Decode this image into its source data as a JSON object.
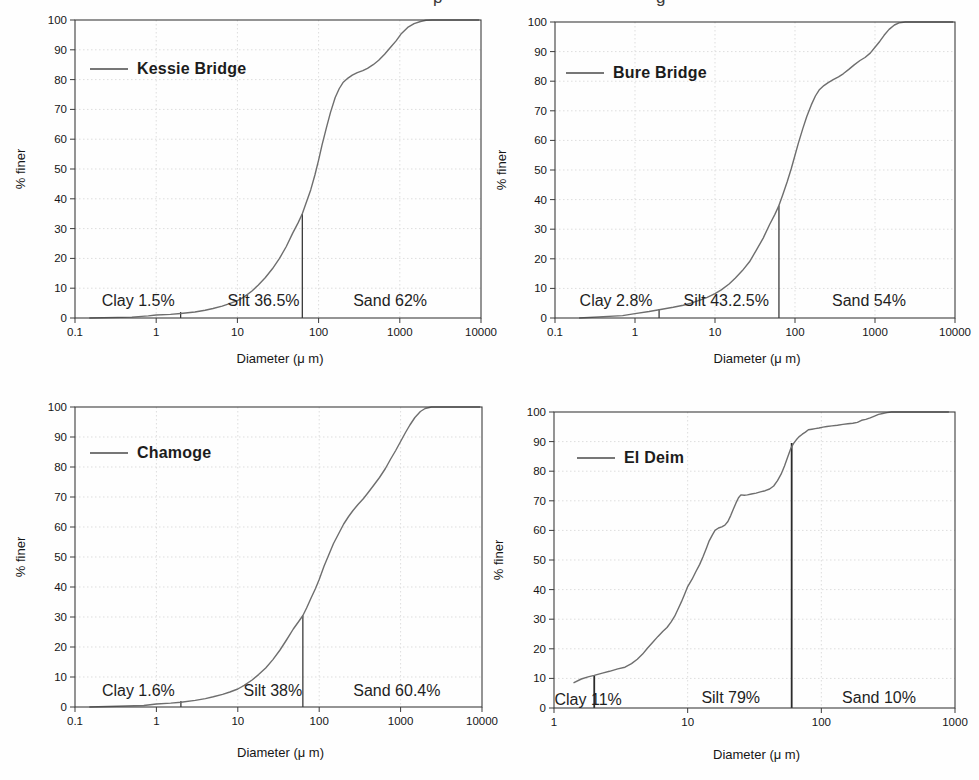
{
  "caption_fragments": [
    "p",
    "g"
  ],
  "colors": {
    "curve": "#6e6e6e",
    "frame": "#3c3c3c",
    "grid": "#dddddd",
    "text": "#161616",
    "annotation": "#1f1f1f",
    "boundary": "#2b2b2b"
  },
  "chart_data": [
    {
      "id": "kessie-bridge",
      "type": "line",
      "legend": "Kessie Bridge",
      "xlabel": "Diameter (μ m)",
      "ylabel": "% finer",
      "xscale": "log",
      "xlim": [
        0.1,
        10000
      ],
      "ylim": [
        0,
        100
      ],
      "x_ticks": [
        "0.1",
        "1",
        "10",
        "100",
        "1000",
        "10000"
      ],
      "y_ticks": [
        "0",
        "10",
        "20",
        "30",
        "40",
        "50",
        "60",
        "70",
        "80",
        "90",
        "100"
      ],
      "grid": true,
      "annotations": [
        {
          "text": "Clay 1.5%",
          "x": 0.6,
          "y": 6
        },
        {
          "text": "Silt 36.5%",
          "x": 21,
          "y": 6
        },
        {
          "text": "Sand 62%",
          "x": 760,
          "y": 6
        }
      ],
      "boundary_lines": [
        {
          "x": 2,
          "y_top": 2
        },
        {
          "x": 63,
          "y_top": 35
        }
      ],
      "series": [
        {
          "name": "Kessie Bridge",
          "points": [
            [
              0.15,
              0
            ],
            [
              0.5,
              0.3
            ],
            [
              0.8,
              0.7
            ],
            [
              1,
              1
            ],
            [
              1.5,
              1.2
            ],
            [
              2,
              1.5
            ],
            [
              3,
              2
            ],
            [
              4,
              2.6
            ],
            [
              5,
              3.2
            ],
            [
              6.5,
              4
            ],
            [
              8,
              4.8
            ],
            [
              10,
              5.8
            ],
            [
              12,
              7
            ],
            [
              15,
              9
            ],
            [
              18,
              11
            ],
            [
              22,
              13.5
            ],
            [
              27,
              16.5
            ],
            [
              33,
              20
            ],
            [
              40,
              24
            ],
            [
              48,
              28.5
            ],
            [
              56,
              32
            ],
            [
              63,
              35
            ],
            [
              70,
              38.5
            ],
            [
              80,
              43
            ],
            [
              90,
              48
            ],
            [
              100,
              53
            ],
            [
              110,
              58
            ],
            [
              125,
              64
            ],
            [
              140,
              69
            ],
            [
              160,
              74
            ],
            [
              180,
              77
            ],
            [
              200,
              79
            ],
            [
              230,
              80.5
            ],
            [
              260,
              81.5
            ],
            [
              300,
              82.3
            ],
            [
              350,
              83
            ],
            [
              400,
              83.8
            ],
            [
              470,
              85
            ],
            [
              550,
              86.5
            ],
            [
              650,
              88.5
            ],
            [
              780,
              91
            ],
            [
              900,
              93
            ],
            [
              1050,
              95.5
            ],
            [
              1250,
              97.5
            ],
            [
              1500,
              98.8
            ],
            [
              1800,
              99.5
            ],
            [
              2100,
              99.9
            ],
            [
              2500,
              100
            ],
            [
              9500,
              100
            ]
          ]
        }
      ]
    },
    {
      "id": "bure-bridge",
      "type": "line",
      "legend": "Bure Bridge",
      "xlabel": "Diameter (μ m)",
      "ylabel": "% finer",
      "xscale": "log",
      "xlim": [
        0.1,
        10000
      ],
      "ylim": [
        0,
        100
      ],
      "x_ticks": [
        "0.1",
        "1",
        "10",
        "100",
        "1000",
        "10000"
      ],
      "y_ticks": [
        "0",
        "10",
        "20",
        "30",
        "40",
        "50",
        "60",
        "70",
        "80",
        "90",
        "100"
      ],
      "grid": true,
      "annotations": [
        {
          "text": "Clay 2.8%",
          "x": 0.58,
          "y": 6
        },
        {
          "text": "Silt 43.2.5%",
          "x": 13.8,
          "y": 6
        },
        {
          "text": "Sand 54%",
          "x": 840,
          "y": 6
        }
      ],
      "boundary_lines": [
        {
          "x": 2,
          "y_top": 3
        },
        {
          "x": 63,
          "y_top": 38
        }
      ],
      "series": [
        {
          "name": "Bure Bridge",
          "points": [
            [
              0.2,
              0
            ],
            [
              0.7,
              0.8
            ],
            [
              1,
              1.5
            ],
            [
              1.5,
              2.2
            ],
            [
              2,
              2.8
            ],
            [
              3,
              3.6
            ],
            [
              4,
              4.3
            ],
            [
              5,
              5
            ],
            [
              6.5,
              6
            ],
            [
              8,
              7
            ],
            [
              10,
              8.2
            ],
            [
              12,
              9.5
            ],
            [
              15,
              11.5
            ],
            [
              18,
              13.5
            ],
            [
              22,
              16
            ],
            [
              27,
              19
            ],
            [
              33,
              23
            ],
            [
              40,
              27
            ],
            [
              48,
              31.5
            ],
            [
              56,
              35
            ],
            [
              63,
              38
            ],
            [
              70,
              41.5
            ],
            [
              80,
              46
            ],
            [
              90,
              50.5
            ],
            [
              100,
              55
            ],
            [
              110,
              59
            ],
            [
              125,
              64
            ],
            [
              140,
              68
            ],
            [
              160,
              72
            ],
            [
              180,
              75
            ],
            [
              200,
              77
            ],
            [
              230,
              78.5
            ],
            [
              260,
              79.5
            ],
            [
              300,
              80.5
            ],
            [
              350,
              81.5
            ],
            [
              400,
              82.5
            ],
            [
              470,
              84
            ],
            [
              550,
              85.5
            ],
            [
              650,
              87
            ],
            [
              750,
              88
            ],
            [
              870,
              89.5
            ],
            [
              1000,
              91.5
            ],
            [
              1150,
              93.5
            ],
            [
              1300,
              95.5
            ],
            [
              1500,
              97.5
            ],
            [
              1750,
              99
            ],
            [
              2000,
              99.7
            ],
            [
              2400,
              100
            ],
            [
              9500,
              100
            ]
          ]
        }
      ]
    },
    {
      "id": "chamoge",
      "type": "line",
      "legend": "Chamoge",
      "xlabel": "Diameter (μ m)",
      "ylabel": "% finer",
      "xscale": "log",
      "xlim": [
        0.1,
        10000
      ],
      "ylim": [
        0,
        100
      ],
      "x_ticks": [
        "0.1",
        "1",
        "10",
        "100",
        "1000",
        "10000"
      ],
      "y_ticks": [
        "0",
        "10",
        "20",
        "30",
        "40",
        "50",
        "60",
        "70",
        "80",
        "90",
        "100"
      ],
      "grid": true,
      "annotations": [
        {
          "text": "Clay 1.6%",
          "x": 0.6,
          "y": 5.5
        },
        {
          "text": "Silt 38%",
          "x": 27,
          "y": 5.5
        },
        {
          "text": "Sand 60.4%",
          "x": 900,
          "y": 5.5
        }
      ],
      "boundary_lines": [
        {
          "x": 2,
          "y_top": 2
        },
        {
          "x": 63,
          "y_top": 30.5
        }
      ],
      "series": [
        {
          "name": "Chamoge",
          "points": [
            [
              0.15,
              0
            ],
            [
              0.7,
              0.5
            ],
            [
              1,
              1
            ],
            [
              1.5,
              1.3
            ],
            [
              2,
              1.6
            ],
            [
              3,
              2.2
            ],
            [
              4,
              2.8
            ],
            [
              5,
              3.4
            ],
            [
              6.5,
              4.2
            ],
            [
              8,
              5
            ],
            [
              10,
              6
            ],
            [
              12,
              7.2
            ],
            [
              15,
              9
            ],
            [
              18,
              10.8
            ],
            [
              22,
              13
            ],
            [
              27,
              15.8
            ],
            [
              33,
              19
            ],
            [
              40,
              22.5
            ],
            [
              48,
              26
            ],
            [
              56,
              28.5
            ],
            [
              63,
              30.5
            ],
            [
              70,
              33
            ],
            [
              80,
              36.5
            ],
            [
              90,
              39.5
            ],
            [
              100,
              42.5
            ],
            [
              115,
              47
            ],
            [
              130,
              50.5
            ],
            [
              150,
              54.5
            ],
            [
              175,
              58
            ],
            [
              200,
              61
            ],
            [
              230,
              63.5
            ],
            [
              260,
              65.5
            ],
            [
              300,
              67.5
            ],
            [
              350,
              69.5
            ],
            [
              400,
              71.5
            ],
            [
              470,
              74
            ],
            [
              550,
              76.5
            ],
            [
              650,
              79.5
            ],
            [
              750,
              82.5
            ],
            [
              870,
              85.5
            ],
            [
              1000,
              88.5
            ],
            [
              1150,
              91.5
            ],
            [
              1300,
              94
            ],
            [
              1500,
              96.5
            ],
            [
              1750,
              98.5
            ],
            [
              2000,
              99.5
            ],
            [
              2400,
              100
            ],
            [
              9500,
              100
            ]
          ]
        }
      ]
    },
    {
      "id": "el-deim",
      "type": "line",
      "legend": "El Deim",
      "xlabel": "Diameter (μ m)",
      "ylabel": "% finer",
      "xscale": "log",
      "xlim": [
        1,
        1000
      ],
      "ylim": [
        0,
        100
      ],
      "x_ticks": [
        "1",
        "10",
        "100",
        "1000"
      ],
      "y_ticks": [
        "0",
        "10",
        "20",
        "30",
        "40",
        "50",
        "60",
        "70",
        "80",
        "90",
        "100"
      ],
      "grid": true,
      "annotations": [
        {
          "text": "Clay 11%",
          "x": 1.8,
          "y": 3
        },
        {
          "text": "Silt 79%",
          "x": 21,
          "y": 3.5
        },
        {
          "text": "Sand 10%",
          "x": 270,
          "y": 3.5
        }
      ],
      "boundary_lines": [
        {
          "x": 2,
          "y_top": 11
        },
        {
          "x": 60,
          "y_top": 89.5
        }
      ],
      "series": [
        {
          "name": "El Deim",
          "points": [
            [
              1.4,
              8.5
            ],
            [
              1.6,
              9.8
            ],
            [
              1.8,
              10.5
            ],
            [
              2,
              11
            ],
            [
              2.3,
              11.8
            ],
            [
              2.6,
              12.4
            ],
            [
              3,
              13.2
            ],
            [
              3.4,
              13.8
            ],
            [
              3.8,
              15
            ],
            [
              4.2,
              16.5
            ],
            [
              4.6,
              18.2
            ],
            [
              5,
              20.2
            ],
            [
              5.5,
              22.3
            ],
            [
              6,
              24.2
            ],
            [
              6.5,
              25.8
            ],
            [
              7,
              27.2
            ],
            [
              7.5,
              29
            ],
            [
              8,
              31
            ],
            [
              8.5,
              33.5
            ],
            [
              9,
              36
            ],
            [
              9.5,
              38.5
            ],
            [
              10,
              41
            ],
            [
              10.8,
              43.5
            ],
            [
              11.5,
              46
            ],
            [
              12.3,
              48.5
            ],
            [
              13,
              51
            ],
            [
              13.8,
              54
            ],
            [
              14.5,
              56.5
            ],
            [
              15.3,
              58.5
            ],
            [
              16,
              60
            ],
            [
              17,
              60.8
            ],
            [
              18,
              61.2
            ],
            [
              19,
              61.8
            ],
            [
              20,
              63
            ],
            [
              21,
              65
            ],
            [
              22,
              67.2
            ],
            [
              23,
              69.3
            ],
            [
              24,
              71
            ],
            [
              25,
              72
            ],
            [
              26.5,
              71.9
            ],
            [
              28,
              72
            ],
            [
              30,
              72.3
            ],
            [
              32.5,
              72.6
            ],
            [
              35,
              73
            ],
            [
              38,
              73.4
            ],
            [
              41,
              74
            ],
            [
              44,
              75
            ],
            [
              47,
              76.8
            ],
            [
              50,
              79
            ],
            [
              53,
              81.8
            ],
            [
              56,
              84.8
            ],
            [
              59,
              87.6
            ],
            [
              62,
              89.4
            ],
            [
              65,
              90.6
            ],
            [
              68,
              91.6
            ],
            [
              72,
              92.5
            ],
            [
              76,
              93.2
            ],
            [
              80,
              94
            ],
            [
              85,
              94.2
            ],
            [
              90,
              94.4
            ],
            [
              96,
              94.6
            ],
            [
              103,
              94.9
            ],
            [
              110,
              95.1
            ],
            [
              120,
              95.3
            ],
            [
              132,
              95.5
            ],
            [
              145,
              95.8
            ],
            [
              158,
              96
            ],
            [
              172,
              96.2
            ],
            [
              186,
              96.5
            ],
            [
              200,
              97.2
            ],
            [
              215,
              97.5
            ],
            [
              232,
              98
            ],
            [
              250,
              98.6
            ],
            [
              268,
              99.2
            ],
            [
              288,
              99.5
            ],
            [
              310,
              99.8
            ],
            [
              335,
              100
            ],
            [
              900,
              100
            ]
          ]
        }
      ]
    }
  ]
}
